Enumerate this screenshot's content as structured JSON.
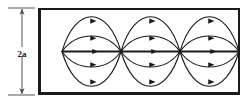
{
  "figure": {
    "background_color": "#ffffff",
    "line_color": "#1a1a1a",
    "border_color": "#1a1a1a"
  },
  "dimension": {
    "label": "2a",
    "orientation": "vertical",
    "arrow_style": "double-headed",
    "x": 22,
    "top_y": 8,
    "bottom_y": 95,
    "tick_left": 8,
    "tick_right": 35,
    "label_x": 22,
    "label_y": 54
  },
  "box": {
    "x": 38,
    "y": 8,
    "width": 202,
    "height": 87,
    "stroke_width_top": 2,
    "stroke_width_bottom": 3,
    "stroke_width_left": 3,
    "stroke_width_right": 2
  },
  "wave": {
    "axis_y": 51.5,
    "node_count": 4,
    "nodes": [
      62,
      121,
      180,
      239
    ],
    "lobe_count": 3,
    "arcs_above_per_lobe": 2,
    "arcs_below_per_lobe": 2,
    "center_line_per_lobe": 1,
    "arc_amplitudes_above": [
      38,
      17
    ],
    "arc_amplitudes_below": [
      17,
      38
    ],
    "arrow_direction": "right",
    "center_line_width": 2,
    "arc_line_width": 1.1,
    "arrowhead_length": 5,
    "arrowhead_half_width": 2.6
  },
  "chart_data": {
    "type": "line",
    "xlabel": "",
    "ylabel": "2a",
    "xlim": [
      38,
      240
    ],
    "ylim": [
      8,
      95
    ],
    "grid": false,
    "legend": false,
    "nodes_x": [
      62,
      121,
      180,
      239
    ],
    "axis_y": 51.5,
    "series": [
      {
        "name": "outer-arc-above",
        "amplitude": 38,
        "direction": "above"
      },
      {
        "name": "inner-arc-above",
        "amplitude": 17,
        "direction": "above"
      },
      {
        "name": "axial-line",
        "amplitude": 0,
        "direction": "center"
      },
      {
        "name": "inner-arc-below",
        "amplitude": 17,
        "direction": "below"
      },
      {
        "name": "outer-arc-below",
        "amplitude": 38,
        "direction": "below"
      }
    ]
  }
}
